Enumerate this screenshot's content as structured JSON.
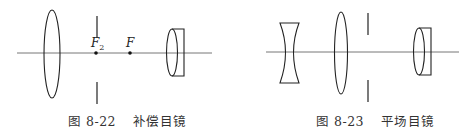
{
  "figures": [
    {
      "id": "fig-8-22",
      "caption_prefix": "图",
      "number": "8-22",
      "title": "补偿目镜",
      "labels": {
        "f2": "F",
        "f2_sub": "2",
        "f": "F"
      }
    },
    {
      "id": "fig-8-23",
      "caption_prefix": "图",
      "number": "8-23",
      "title": "平场目镜"
    }
  ],
  "colors": {
    "line": "#222222",
    "axis": "#555555",
    "caption": "#333333"
  }
}
